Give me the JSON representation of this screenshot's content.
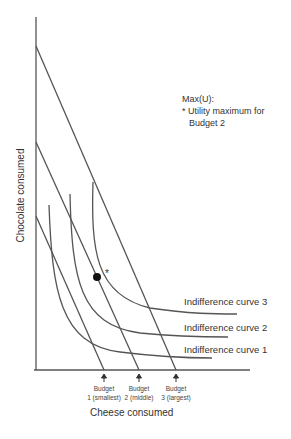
{
  "diagram": {
    "type": "indifference-curve-budget-diagram",
    "axes": {
      "x_label": "Cheese consumed",
      "y_label": "Chocolate consumed"
    },
    "annotation": {
      "line1": "Max(U):",
      "line2": "* Utility maximum for",
      "line3": "Budget 2"
    },
    "indifference_curves": [
      {
        "label": "Indifference curve 1"
      },
      {
        "label": "Indifference curve 2"
      },
      {
        "label": "Indifference curve 3"
      }
    ],
    "budgets": [
      {
        "line1": "Budget",
        "line2": "1 (smallest)"
      },
      {
        "line1": "Budget",
        "line2": "2 (middle)"
      },
      {
        "line1": "Budget",
        "line2": "3 (largest)"
      }
    ],
    "optimum_marker": "*",
    "colors": {
      "line": "#555555",
      "text": "#333333",
      "point": "#111111"
    }
  }
}
